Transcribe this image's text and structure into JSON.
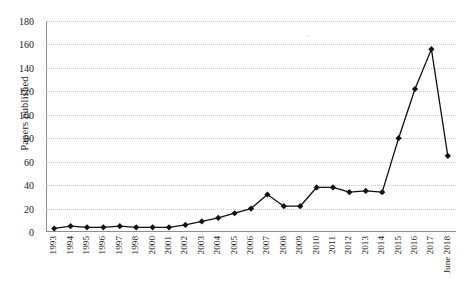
{
  "chart_data": {
    "type": "line",
    "title": "",
    "xlabel": "",
    "ylabel": "Papers published",
    "ylim": [
      0,
      180
    ],
    "ytick_step": 20,
    "yticks": [
      0,
      20,
      40,
      60,
      80,
      100,
      120,
      140,
      160,
      180
    ],
    "grid": "horizontal-dotted",
    "legend": "none",
    "marker": "diamond",
    "line_color": "#111111",
    "marker_color": "#111111",
    "grid_color": "#c9c9c9",
    "axis_color": "#8d8d8d",
    "categories": [
      "1993",
      "1994",
      "1995",
      "1996",
      "1997",
      "1998",
      "2000",
      "2001",
      "2002",
      "2003",
      "2004",
      "2005",
      "2006",
      "2007",
      "2008",
      "2009",
      "2010",
      "2011",
      "2012",
      "2013",
      "2014",
      "2015",
      "2016",
      "2017",
      "June 2018"
    ],
    "values": [
      3,
      5,
      4,
      4,
      5,
      4,
      4,
      4,
      6,
      9,
      12,
      16,
      20,
      32,
      22,
      22,
      38,
      38,
      34,
      35,
      34,
      80,
      122,
      156,
      65
    ],
    "series": [
      {
        "name": "Papers published",
        "values": [
          3,
          5,
          4,
          4,
          5,
          4,
          4,
          4,
          6,
          9,
          12,
          16,
          20,
          32,
          22,
          22,
          38,
          38,
          34,
          35,
          34,
          80,
          122,
          156,
          65
        ]
      }
    ]
  }
}
